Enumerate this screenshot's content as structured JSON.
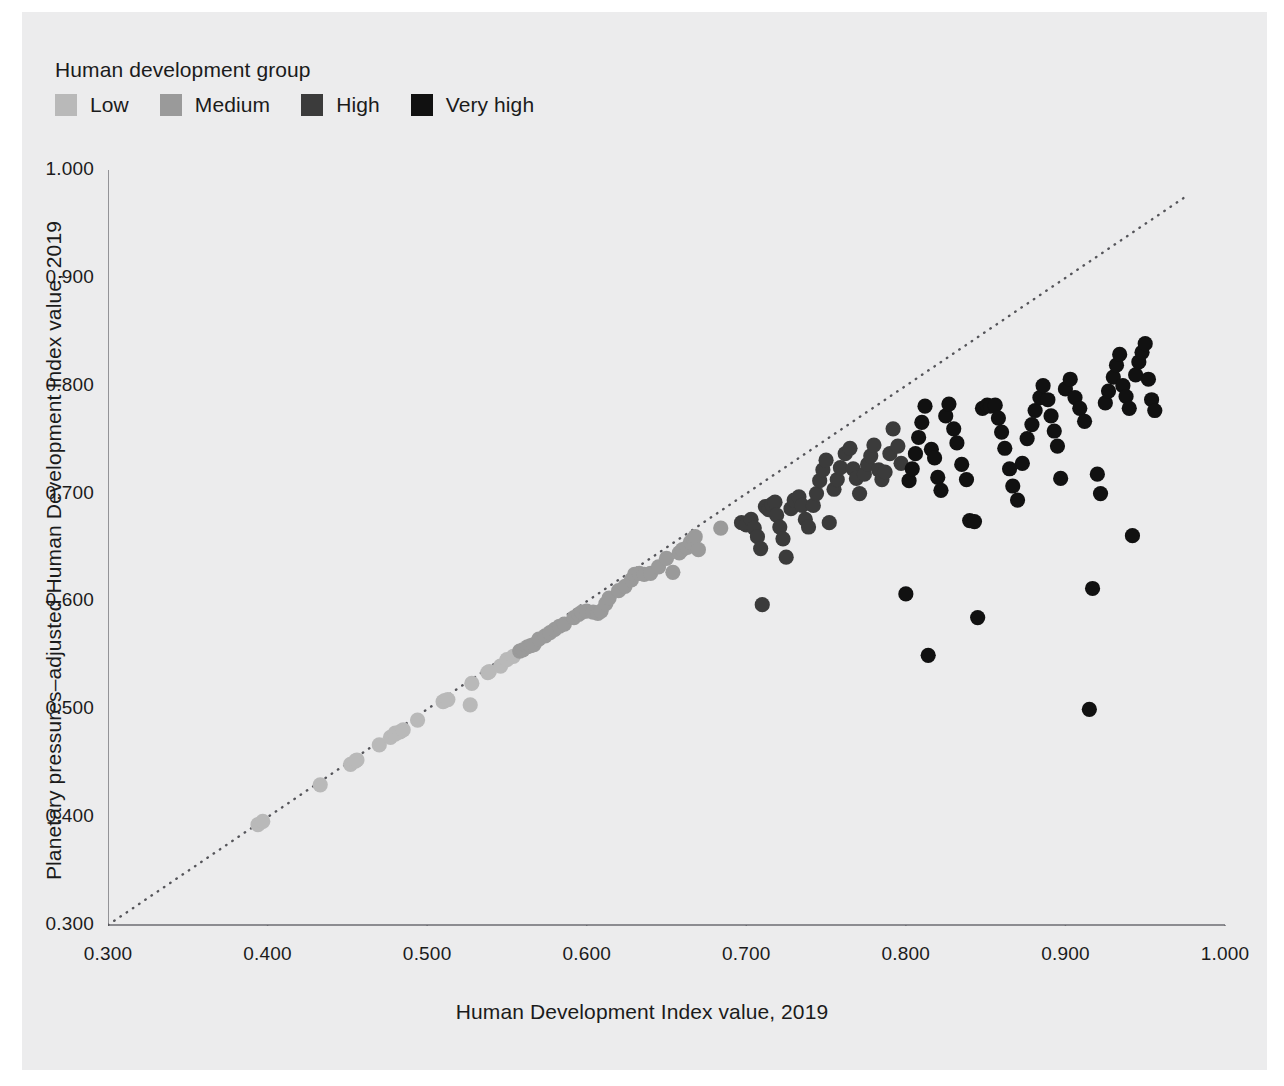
{
  "legend": {
    "title": "Human development group",
    "items": [
      {
        "label": "Low",
        "color": "#b9b9b9"
      },
      {
        "label": "Medium",
        "color": "#9a9a9a"
      },
      {
        "label": "High",
        "color": "#3b3b3b"
      },
      {
        "label": "Very high",
        "color": "#111111"
      }
    ]
  },
  "axes": {
    "x_title": "Human Development Index value, 2019",
    "y_title": "Planetary pressures–adjusted Human Development Index value, 2019",
    "x_ticks": [
      "0.300",
      "0.400",
      "0.500",
      "0.600",
      "0.700",
      "0.800",
      "0.900",
      "1.000"
    ],
    "y_ticks": [
      "0.300",
      "0.400",
      "0.500",
      "0.600",
      "0.700",
      "0.800",
      "0.900",
      "1.000"
    ]
  },
  "chart_data": {
    "type": "scatter",
    "title": "",
    "xlabel": "Human Development Index value, 2019",
    "ylabel": "Planetary pressures–adjusted Human Development Index value, 2019",
    "xlim": [
      0.3,
      1.0
    ],
    "ylim": [
      0.3,
      1.0
    ],
    "xticks": [
      0.3,
      0.4,
      0.5,
      0.6,
      0.7,
      0.8,
      0.9,
      1.0
    ],
    "yticks": [
      0.3,
      0.4,
      0.5,
      0.6,
      0.7,
      0.8,
      0.9,
      1.0
    ],
    "grid": false,
    "legend_position": "top-left",
    "reference_line": {
      "label": "y = x (identity line)",
      "style": "dotted",
      "color": "#55555a",
      "from": [
        0.3,
        0.3
      ],
      "to": [
        0.975,
        0.975
      ]
    },
    "series": [
      {
        "name": "Low",
        "color": "#b9b9b9",
        "points": [
          [
            0.394,
            0.393
          ],
          [
            0.397,
            0.396
          ],
          [
            0.433,
            0.43
          ],
          [
            0.452,
            0.449
          ],
          [
            0.455,
            0.452
          ],
          [
            0.456,
            0.453
          ],
          [
            0.47,
            0.467
          ],
          [
            0.477,
            0.474
          ],
          [
            0.48,
            0.477
          ],
          [
            0.48,
            0.478
          ],
          [
            0.483,
            0.479
          ],
          [
            0.485,
            0.481
          ],
          [
            0.494,
            0.49
          ],
          [
            0.51,
            0.507
          ],
          [
            0.511,
            0.508
          ],
          [
            0.513,
            0.509
          ],
          [
            0.527,
            0.504
          ],
          [
            0.528,
            0.524
          ],
          [
            0.538,
            0.534
          ],
          [
            0.539,
            0.535
          ],
          [
            0.546,
            0.54
          ],
          [
            0.55,
            0.546
          ],
          [
            0.554,
            0.549
          ]
        ]
      },
      {
        "name": "Medium",
        "color": "#9a9a9a",
        "points": [
          [
            0.558,
            0.554
          ],
          [
            0.56,
            0.555
          ],
          [
            0.563,
            0.558
          ],
          [
            0.565,
            0.559
          ],
          [
            0.567,
            0.56
          ],
          [
            0.57,
            0.565
          ],
          [
            0.574,
            0.568
          ],
          [
            0.577,
            0.571
          ],
          [
            0.58,
            0.574
          ],
          [
            0.583,
            0.577
          ],
          [
            0.586,
            0.579
          ],
          [
            0.592,
            0.585
          ],
          [
            0.595,
            0.588
          ],
          [
            0.597,
            0.59
          ],
          [
            0.6,
            0.591
          ],
          [
            0.604,
            0.59
          ],
          [
            0.607,
            0.589
          ],
          [
            0.609,
            0.591
          ],
          [
            0.612,
            0.598
          ],
          [
            0.614,
            0.603
          ],
          [
            0.62,
            0.61
          ],
          [
            0.624,
            0.614
          ],
          [
            0.628,
            0.62
          ],
          [
            0.63,
            0.625
          ],
          [
            0.633,
            0.626
          ],
          [
            0.636,
            0.625
          ],
          [
            0.64,
            0.626
          ],
          [
            0.645,
            0.632
          ],
          [
            0.65,
            0.64
          ],
          [
            0.654,
            0.627
          ],
          [
            0.658,
            0.645
          ],
          [
            0.66,
            0.648
          ],
          [
            0.663,
            0.65
          ],
          [
            0.665,
            0.655
          ],
          [
            0.667,
            0.658
          ],
          [
            0.668,
            0.66
          ],
          [
            0.67,
            0.648
          ],
          [
            0.684,
            0.668
          ]
        ]
      },
      {
        "name": "High",
        "color": "#3b3b3b",
        "points": [
          [
            0.697,
            0.673
          ],
          [
            0.7,
            0.671
          ],
          [
            0.703,
            0.676
          ],
          [
            0.705,
            0.668
          ],
          [
            0.707,
            0.66
          ],
          [
            0.709,
            0.649
          ],
          [
            0.71,
            0.597
          ],
          [
            0.712,
            0.688
          ],
          [
            0.714,
            0.685
          ],
          [
            0.716,
            0.69
          ],
          [
            0.718,
            0.692
          ],
          [
            0.719,
            0.68
          ],
          [
            0.721,
            0.669
          ],
          [
            0.723,
            0.658
          ],
          [
            0.725,
            0.641
          ],
          [
            0.728,
            0.686
          ],
          [
            0.73,
            0.694
          ],
          [
            0.733,
            0.697
          ],
          [
            0.735,
            0.689
          ],
          [
            0.737,
            0.676
          ],
          [
            0.739,
            0.669
          ],
          [
            0.742,
            0.689
          ],
          [
            0.744,
            0.7
          ],
          [
            0.746,
            0.712
          ],
          [
            0.748,
            0.722
          ],
          [
            0.75,
            0.731
          ],
          [
            0.752,
            0.673
          ],
          [
            0.755,
            0.704
          ],
          [
            0.757,
            0.713
          ],
          [
            0.759,
            0.724
          ],
          [
            0.762,
            0.737
          ],
          [
            0.765,
            0.742
          ],
          [
            0.767,
            0.723
          ],
          [
            0.769,
            0.714
          ],
          [
            0.771,
            0.7
          ],
          [
            0.774,
            0.718
          ],
          [
            0.776,
            0.727
          ],
          [
            0.778,
            0.735
          ],
          [
            0.78,
            0.745
          ],
          [
            0.783,
            0.722
          ],
          [
            0.785,
            0.713
          ],
          [
            0.787,
            0.72
          ],
          [
            0.79,
            0.737
          ],
          [
            0.792,
            0.76
          ],
          [
            0.795,
            0.744
          ],
          [
            0.797,
            0.728
          ]
        ]
      },
      {
        "name": "Very high",
        "color": "#111111",
        "points": [
          [
            0.8,
            0.607
          ],
          [
            0.802,
            0.712
          ],
          [
            0.804,
            0.723
          ],
          [
            0.806,
            0.737
          ],
          [
            0.808,
            0.752
          ],
          [
            0.81,
            0.766
          ],
          [
            0.812,
            0.781
          ],
          [
            0.814,
            0.55
          ],
          [
            0.816,
            0.741
          ],
          [
            0.818,
            0.733
          ],
          [
            0.82,
            0.715
          ],
          [
            0.822,
            0.703
          ],
          [
            0.825,
            0.772
          ],
          [
            0.827,
            0.783
          ],
          [
            0.83,
            0.76
          ],
          [
            0.832,
            0.747
          ],
          [
            0.835,
            0.727
          ],
          [
            0.838,
            0.713
          ],
          [
            0.84,
            0.675
          ],
          [
            0.843,
            0.674
          ],
          [
            0.845,
            0.585
          ],
          [
            0.848,
            0.779
          ],
          [
            0.851,
            0.782
          ],
          [
            0.853,
            0.781
          ],
          [
            0.856,
            0.782
          ],
          [
            0.858,
            0.77
          ],
          [
            0.86,
            0.757
          ],
          [
            0.862,
            0.742
          ],
          [
            0.865,
            0.723
          ],
          [
            0.867,
            0.707
          ],
          [
            0.87,
            0.694
          ],
          [
            0.873,
            0.728
          ],
          [
            0.876,
            0.751
          ],
          [
            0.879,
            0.764
          ],
          [
            0.881,
            0.777
          ],
          [
            0.884,
            0.789
          ],
          [
            0.886,
            0.8
          ],
          [
            0.889,
            0.787
          ],
          [
            0.891,
            0.772
          ],
          [
            0.893,
            0.758
          ],
          [
            0.895,
            0.744
          ],
          [
            0.897,
            0.714
          ],
          [
            0.9,
            0.797
          ],
          [
            0.903,
            0.806
          ],
          [
            0.906,
            0.789
          ],
          [
            0.909,
            0.779
          ],
          [
            0.912,
            0.767
          ],
          [
            0.915,
            0.5
          ],
          [
            0.917,
            0.612
          ],
          [
            0.92,
            0.718
          ],
          [
            0.922,
            0.7
          ],
          [
            0.925,
            0.784
          ],
          [
            0.927,
            0.795
          ],
          [
            0.93,
            0.808
          ],
          [
            0.932,
            0.819
          ],
          [
            0.934,
            0.829
          ],
          [
            0.936,
            0.8
          ],
          [
            0.938,
            0.79
          ],
          [
            0.94,
            0.779
          ],
          [
            0.942,
            0.661
          ],
          [
            0.944,
            0.81
          ],
          [
            0.946,
            0.822
          ],
          [
            0.948,
            0.831
          ],
          [
            0.95,
            0.839
          ],
          [
            0.952,
            0.806
          ],
          [
            0.954,
            0.787
          ],
          [
            0.956,
            0.777
          ]
        ]
      }
    ]
  }
}
